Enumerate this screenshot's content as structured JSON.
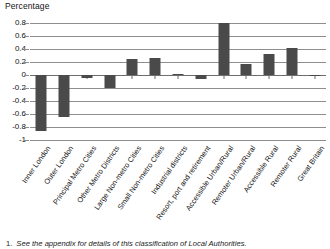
{
  "chart_data": {
    "type": "bar",
    "title": "",
    "ylabel": "Percentage",
    "xlabel": "",
    "ylim": [
      -1,
      0.8
    ],
    "yticks": [
      0.8,
      0.6,
      0.4,
      0.2,
      0,
      -0.2,
      -0.4,
      -0.6,
      -0.8,
      -1
    ],
    "ytick_labels": [
      "0.8",
      "0.6",
      "0.4",
      "0.2",
      "0",
      "-0.2",
      "-0.4",
      "-0.6",
      "-0.8",
      "-1"
    ],
    "grid": true,
    "legend": "none",
    "bar_color": "#4a4a4a",
    "categories": [
      "Inner London",
      "Outer London",
      "Principal Metro Cities",
      "Other Metro Districts",
      "Large Non-metro Cities",
      "Small Non-metro Cities",
      "Industrial districts",
      "Resort, port and retirement",
      "Accessible Urban/Rural",
      "Remoter Urban/Rural",
      "Accessible Rural",
      "Remoter Rural",
      "Great Britain"
    ],
    "values": [
      -0.86,
      -0.64,
      -0.05,
      -0.2,
      0.24,
      0.26,
      0.02,
      -0.06,
      0.8,
      0.17,
      0.32,
      0.42,
      0.0
    ]
  },
  "footnote": {
    "marker": "1.",
    "text": "See the appendix for details of this classification of Local Authorities."
  }
}
